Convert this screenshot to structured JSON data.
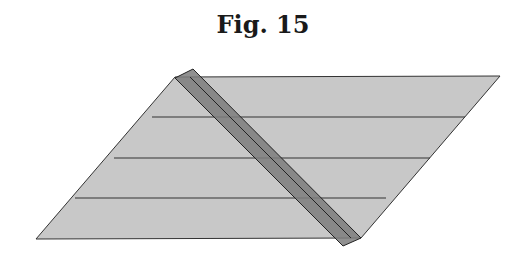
{
  "figure": {
    "title": "Fig. 15"
  },
  "diagram": {
    "parallelogram": {
      "points": [
        [
          175,
          77
        ],
        [
          500,
          76
        ],
        [
          361,
          238
        ],
        [
          36,
          239
        ]
      ],
      "fill": "#c8c8c8",
      "stroke": "#333333"
    },
    "horizontal_lines": [
      {
        "y": 117,
        "x1": 152,
        "x2": 465
      },
      {
        "y": 158,
        "x1": 114,
        "x2": 425
      },
      {
        "y": 198,
        "x1": 75,
        "x2": 386
      }
    ],
    "strip": {
      "outer": [
        [
          175,
          78
        ],
        [
          193,
          69
        ],
        [
          361,
          238
        ],
        [
          343,
          246
        ]
      ],
      "center_line": [
        [
          184,
          74
        ],
        [
          352,
          242
        ]
      ],
      "fill": "#7d7d7d",
      "stroke": "#222222"
    }
  }
}
